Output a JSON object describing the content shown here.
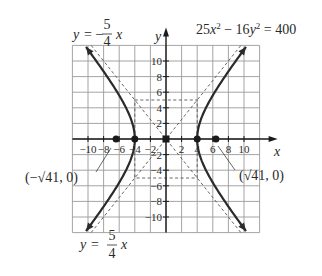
{
  "chart_data": {
    "type": "line",
    "xlabel": "x",
    "ylabel": "y",
    "xlim": [
      -12,
      12
    ],
    "ylim": [
      -12,
      12
    ],
    "grid": true,
    "grid_step": 2,
    "x_ticks": [
      -10,
      -8,
      -6,
      -4,
      -2,
      2,
      4,
      6,
      8,
      10
    ],
    "y_ticks": [
      -10,
      -8,
      -6,
      -4,
      -2,
      2,
      4,
      6,
      8,
      10
    ],
    "x_tick_labels": [
      "−10",
      "−8",
      "−6",
      "−4",
      "−2",
      "2",
      "4",
      "6",
      "8",
      "10"
    ],
    "y_tick_labels": [
      "−10",
      "−8",
      "−6",
      "−4",
      "−2",
      "2",
      "4",
      "6",
      "8",
      "10"
    ],
    "series": [
      {
        "name": "hyperbola",
        "equation": "25x^2 - 16y^2 = 400",
        "style": "solid-bold",
        "a": 4,
        "b": 5,
        "vertices": [
          [
            -4,
            0
          ],
          [
            4,
            0
          ]
        ]
      },
      {
        "name": "asymptote-negative",
        "equation": "y = -5/4 x",
        "style": "dashed"
      },
      {
        "name": "asymptote-positive",
        "equation": "y = 5/4 x",
        "style": "dashed"
      },
      {
        "name": "fundamental-rectangle",
        "corners": [
          [
            -4,
            -5
          ],
          [
            4,
            -5
          ],
          [
            4,
            5
          ],
          [
            -4,
            5
          ]
        ],
        "style": "dashed"
      }
    ],
    "points": [
      {
        "label": "center",
        "x": 0,
        "y": 0
      },
      {
        "label": "vertex-left",
        "x": -4,
        "y": 0
      },
      {
        "label": "vertex-right",
        "x": 4,
        "y": 0
      },
      {
        "label": "(−√41, 0)",
        "x": -6.4,
        "y": 0
      },
      {
        "label": "(√41, 0)",
        "x": 6.4,
        "y": 0
      }
    ],
    "annotations": [
      {
        "text": "y = −5/4 x",
        "position": "top-left"
      },
      {
        "text": "25x² − 16y² = 400",
        "position": "top-right"
      },
      {
        "text": "(−√41, 0)",
        "position": "left",
        "points_to": [
          -6.4,
          0
        ]
      },
      {
        "text": "(√41, 0)",
        "position": "right",
        "points_to": [
          6.4,
          0
        ]
      },
      {
        "text": "y = 5/4 x",
        "position": "bottom-left"
      }
    ]
  },
  "labels": {
    "x_axis": "x",
    "y_axis": "y",
    "equation_main": "25x² − 16y² = 400",
    "asym_top_y": "y =",
    "asym_top_sign": "−",
    "asym_top_num": "5",
    "asym_top_den": "4",
    "asym_top_x": "x",
    "asym_bot_y": "y =",
    "asym_bot_num": "5",
    "asym_bot_den": "4",
    "asym_bot_x": "x",
    "focus_left": "(−√41, 0)",
    "focus_right": "(√41, 0)"
  },
  "colors": {
    "curve": "#2b2b2b",
    "grid": "#9a9a9a",
    "axis": "#1a1a1a",
    "dashed": "#555555",
    "text": "#2a2a2a"
  }
}
